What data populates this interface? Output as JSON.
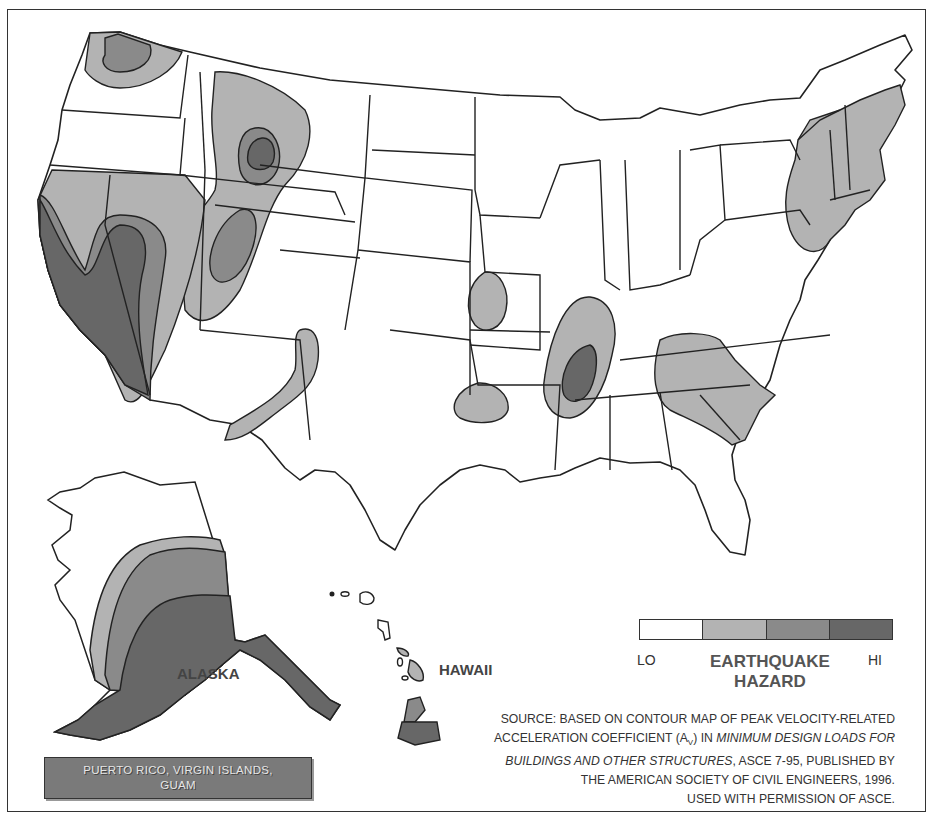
{
  "map": {
    "title": "Earthquake Hazard",
    "regions": {
      "alaska_label": "ALASKA",
      "hawaii_label": "HAWAII",
      "territories_label_line1": "PUERTO RICO, VIRGIN ISLANDS,",
      "territories_label_line2": "GUAM"
    }
  },
  "legend": {
    "lo_label": "LO",
    "hi_label": "HI",
    "title_line1": "EARTHQUAKE",
    "title_line2": "HAZARD",
    "levels": [
      {
        "level": 1,
        "color": "#ffffff"
      },
      {
        "level": 2,
        "color": "#b3b3b3"
      },
      {
        "level": 3,
        "color": "#8a8a8a"
      },
      {
        "level": 4,
        "color": "#676767"
      }
    ]
  },
  "source": {
    "line1": "SOURCE: BASED ON CONTOUR MAP OF PEAK VELOCITY-RELATED",
    "line2_pre": "ACCELERATION COEFFICIENT (A",
    "line2_sub": "V",
    "line2_mid": ") IN ",
    "line2_italic": "MINIMUM DESIGN LOADS FOR",
    "line3_italic": "BUILDINGS AND OTHER STRUCTURES",
    "line3_rest": ", ASCE 7-95, PUBLISHED BY",
    "line4": "THE AMERICAN SOCIETY OF CIVIL ENGINEERS, 1996.",
    "line5": "USED WITH PERMISSION OF ASCE."
  }
}
